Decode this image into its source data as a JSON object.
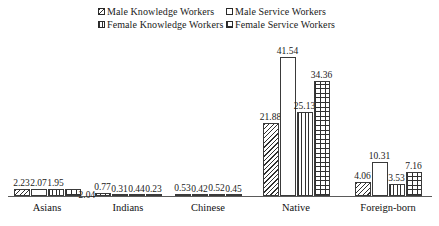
{
  "chart_data": {
    "type": "bar",
    "title": "",
    "subtitle": "",
    "xlabel": "",
    "ylabel": "",
    "grid": false,
    "legend_position": "top",
    "axis_visible": "x-only",
    "ylim": [
      0,
      41.54
    ],
    "categories": [
      "Asians",
      "Indians",
      "Chinese",
      "Native",
      "Foreign-born"
    ],
    "series": [
      {
        "name": "Male  Knowledge Workers",
        "pattern": "diagonal-hatch",
        "values": [
          2.23,
          0.77,
          0.53,
          21.88,
          4.06
        ]
      },
      {
        "name": "Male Service Workers",
        "pattern": "light-dots",
        "values": [
          2.07,
          0.31,
          0.42,
          41.54,
          10.31
        ]
      },
      {
        "name": "Female Knowledge Workers",
        "pattern": "vertical-lines",
        "values": [
          1.95,
          0.44,
          0.52,
          25.13,
          3.53
        ]
      },
      {
        "name": "Female Service Workers",
        "pattern": "brick-grid",
        "values": [
          2.04,
          0.23,
          0.45,
          34.36,
          7.16
        ]
      }
    ],
    "value_labels": [
      [
        "2.23",
        "2.07",
        "1.95",
        "2.04"
      ],
      [
        "0.77",
        "0.31",
        "0.44",
        "0.23"
      ],
      [
        "0.53",
        "0.42",
        "0.52",
        "0.45"
      ],
      [
        "21.88",
        "41.54",
        "25.13",
        "34.36"
      ],
      [
        "4.06",
        "10.31",
        "3.53",
        "7.16"
      ]
    ]
  },
  "legend": {
    "items": [
      {
        "label": "Male  Knowledge Workers",
        "pattern": "diagonal-hatch",
        "row": 0,
        "col": 0
      },
      {
        "label": "Male Service Workers",
        "pattern": "light-dots",
        "row": 0,
        "col": 1
      },
      {
        "label": "Female Knowledge Workers",
        "pattern": "vertical-lines",
        "row": 1,
        "col": 0
      },
      {
        "label": "Female Service Workers",
        "pattern": "brick-grid",
        "row": 1,
        "col": 1
      }
    ]
  },
  "layout": {
    "group_centers_px": [
      47,
      128,
      208,
      296,
      388
    ],
    "baseline_y_px": 196,
    "px_per_unit": 3.345,
    "bar_width_px": 16,
    "label_offsets": [
      [
        -11,
        0,
        -11,
        11
      ],
      [
        0,
        -11,
        0,
        -11
      ],
      [
        0,
        -11,
        0,
        -11
      ],
      [
        0,
        -11,
        0,
        -11
      ],
      [
        0,
        -11,
        0,
        -11
      ]
    ]
  },
  "colors": {
    "ink": "#1a1a1a",
    "bar_outline": "#3a3a3a",
    "axis": "#5a5a5a",
    "background": "#ffffff"
  }
}
